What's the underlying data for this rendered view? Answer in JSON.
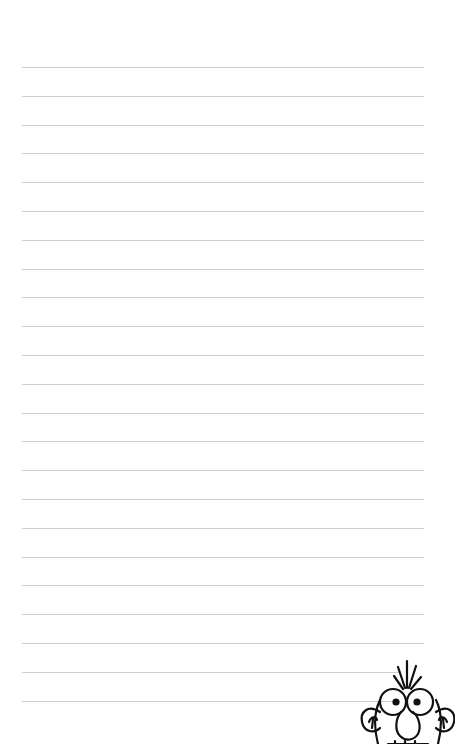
{
  "page": {
    "type": "lined-notepaper",
    "background_color": "#ffffff",
    "line_color": "#cdcdcd",
    "line_count": 23,
    "first_line_y": 67,
    "line_spacing": 28.8,
    "line_left": 22,
    "line_right": 424
  },
  "decoration": {
    "icon": "cartoon-face-icon",
    "stroke_color": "#111111",
    "position": "bottom-right"
  }
}
